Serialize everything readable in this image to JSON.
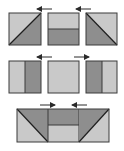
{
  "diagram": {
    "colors": {
      "light": "#c9c9c9",
      "dark": "#8e8e8e",
      "stroke": "#3a3a3a",
      "arrow": "#2a2a2a",
      "background": "#ffffff"
    },
    "rows": [
      {
        "panels": [
          {
            "id": "r1-left",
            "type": "diagonal-up",
            "light": "top-left",
            "dark": "bottom-right"
          },
          {
            "id": "r1-middle",
            "type": "horizontal-split",
            "light": "top",
            "dark": "bottom"
          },
          {
            "id": "r1-right",
            "type": "diagonal-down",
            "light": "top-right",
            "dark": "bottom-left"
          }
        ],
        "arrows": [
          {
            "id": "r1-arrow-1",
            "direction": "left"
          },
          {
            "id": "r1-arrow-2",
            "direction": "left"
          }
        ]
      },
      {
        "panels": [
          {
            "id": "r2-left",
            "type": "vertical-split",
            "light": "left",
            "dark": "right"
          },
          {
            "id": "r2-middle",
            "type": "solid",
            "light": "all"
          },
          {
            "id": "r2-right",
            "type": "vertical-split",
            "light": "right",
            "dark": "left"
          }
        ],
        "arrows": [
          {
            "id": "r2-arrow-1",
            "direction": "left"
          },
          {
            "id": "r2-arrow-2",
            "direction": "right"
          }
        ]
      },
      {
        "panels": [
          {
            "id": "r3-combined",
            "type": "composite-strip"
          }
        ],
        "arrows": [
          {
            "id": "r3-arrow-1",
            "direction": "right"
          },
          {
            "id": "r3-arrow-2",
            "direction": "left"
          }
        ]
      }
    ]
  }
}
